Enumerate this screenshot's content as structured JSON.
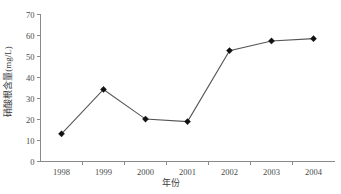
{
  "chart_data": {
    "type": "line",
    "title": "",
    "subtitle": "",
    "xlabel": "年份",
    "ylabel": "硝酸根含量(mg/L)",
    "categories": [
      "1998",
      "1999",
      "2000",
      "2001",
      "2002",
      "2003",
      "2004"
    ],
    "x": [
      1998,
      1999,
      2000,
      2001,
      2002,
      2003,
      2004
    ],
    "values": [
      13.2,
      34.3,
      20.2,
      19.0,
      52.8,
      57.4,
      58.5
    ],
    "series": [
      {
        "name": "硝酸根含量",
        "values": [
          13.2,
          34.3,
          20.2,
          19.0,
          52.8,
          57.4,
          58.5
        ]
      }
    ],
    "ylim": [
      0,
      70
    ],
    "yticks": [
      0,
      10,
      20,
      30,
      40,
      50,
      60,
      70
    ],
    "ytick_labels": [
      "0",
      "10",
      "20",
      "30",
      "40",
      "50",
      "60",
      "70"
    ],
    "xtick_labels": [
      "1998",
      "1999",
      "2000",
      "2001",
      "2002",
      "2003",
      "2004"
    ],
    "grid": false,
    "legend": false,
    "legend_position": "none",
    "marker": "diamond",
    "line_color": "#555555",
    "marker_color": "#111111",
    "axis_color": "#8a8a8a",
    "background_color": "#ffffff"
  },
  "axis_labels": {
    "y_title": "硝酸根含量(mg/L)",
    "x_title": "年份"
  }
}
